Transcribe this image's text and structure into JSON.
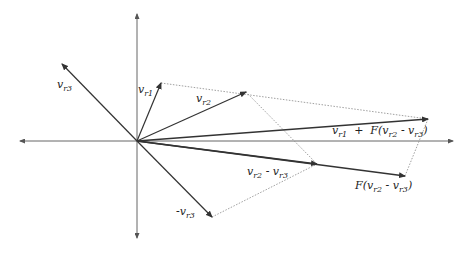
{
  "diagram": {
    "origin": [
      137,
      141
    ],
    "axes": {
      "horizontal": {
        "from": [
          20,
          141
        ],
        "to": [
          453,
          141
        ]
      },
      "vertical": {
        "from": [
          137,
          238
        ],
        "to": [
          137,
          14
        ]
      }
    },
    "vectors": [
      {
        "id": "vr1",
        "base": "v",
        "sub": "r1",
        "tip": [
          161,
          83
        ],
        "label_pos": [
          138,
          88
        ],
        "weight": 1.2
      },
      {
        "id": "vr2",
        "base": "v",
        "sub": "r2",
        "tip": [
          246,
          92
        ],
        "label_pos": [
          196,
          95
        ],
        "weight": 1.2
      },
      {
        "id": "vr3",
        "base": "v",
        "sub": "r3",
        "tip": [
          62,
          64
        ],
        "label_pos": [
          58,
          80
        ],
        "weight": 1.2
      },
      {
        "id": "neg-vr3",
        "base": "-v",
        "sub": "r3",
        "tip": [
          212,
          217
        ],
        "label_pos": [
          176,
          209
        ],
        "weight": 1.2
      },
      {
        "id": "vr2-minus-vr3",
        "base": "v",
        "sub": "r2",
        "tip": [
          317,
          164
        ],
        "label_pos": [
          248,
          167
        ],
        "weight": 1.4,
        "suffix": " - v",
        "suffix_sub": "r3"
      },
      {
        "id": "F-vr2-minus-vr3",
        "tip": [
          405,
          176
        ],
        "label_pos": [
          355,
          180
        ],
        "weight": 1.4,
        "text": "F(v",
        "sub": "r2",
        "mid": " - v",
        "sub2": "r3",
        "close": ")"
      },
      {
        "id": "sum",
        "tip": [
          428,
          119
        ],
        "label_pos": [
          332,
          127
        ],
        "weight": 1.6,
        "text": "v",
        "sub": "r1",
        "mid": "  +  F(v",
        "sub2": "r2",
        "mid2": " - v",
        "sub3": "r3",
        "close": ")"
      }
    ],
    "dotted_lines": [
      {
        "from": [
          161,
          83
        ],
        "to": [
          428,
          119
        ]
      },
      {
        "from": [
          246,
          92
        ],
        "to": [
          317,
          164
        ]
      },
      {
        "from": [
          212,
          217
        ],
        "to": [
          317,
          164
        ]
      },
      {
        "from": [
          405,
          176
        ],
        "to": [
          428,
          119
        ]
      }
    ],
    "colors": {
      "axis": "#555555",
      "vector": "#333333",
      "dotted": "#888888",
      "text": "#222222"
    }
  }
}
